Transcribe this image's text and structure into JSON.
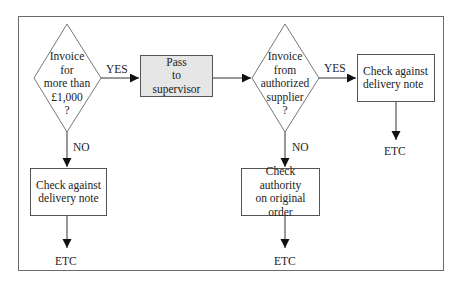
{
  "diagram": {
    "type": "flowchart",
    "nodes": {
      "decision_1": {
        "shape": "diamond",
        "text": "Invoice\nfor\nmore than\n£1,000\n?"
      },
      "process_pass": {
        "shape": "rect",
        "fill": "#e6e6e6",
        "text": "Pass\nto\nsupervisor"
      },
      "decision_2": {
        "shape": "diamond",
        "text": "Invoice\nfrom\nauthorized\nsupplier\n?"
      },
      "process_check_right": {
        "shape": "rect",
        "text": "Check against\ndelivery note"
      },
      "process_check_left": {
        "shape": "rect",
        "text": "Check against\ndelivery note"
      },
      "process_authority": {
        "shape": "rect",
        "text": "Check authority\non original order"
      },
      "end_right": {
        "text": "ETC"
      },
      "end_left": {
        "text": "ETC"
      },
      "end_middle": {
        "text": "ETC"
      }
    },
    "edge_labels": {
      "d1_yes": "YES",
      "d1_no": "NO",
      "d2_yes": "YES",
      "d2_no": "NO"
    },
    "edges": [
      {
        "from": "decision_1",
        "to": "process_pass",
        "label": "YES"
      },
      {
        "from": "process_pass",
        "to": "decision_2",
        "label": ""
      },
      {
        "from": "decision_2",
        "to": "process_check_right",
        "label": "YES"
      },
      {
        "from": "decision_1",
        "to": "process_check_left",
        "label": "NO"
      },
      {
        "from": "decision_2",
        "to": "process_authority",
        "label": "NO"
      },
      {
        "from": "process_check_right",
        "to": "end_right",
        "label": ""
      },
      {
        "from": "process_check_left",
        "to": "end_left",
        "label": ""
      },
      {
        "from": "process_authority",
        "to": "end_middle",
        "label": ""
      }
    ],
    "colors": {
      "line": "#333333",
      "frame": "#6a6a6a",
      "shaded_fill": "#e6e6e6"
    }
  }
}
